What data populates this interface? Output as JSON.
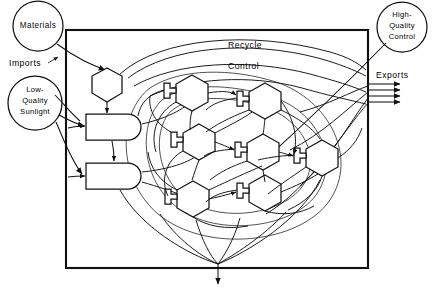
{
  "diagram": {
    "type": "odum-energy-systems-diagram",
    "background_color": "#ffffff",
    "line_color": "#111111"
  },
  "external_sources": [
    {
      "id": "materials",
      "label": "Materials",
      "shape": "circle",
      "cx": 38,
      "cy": 26,
      "r": 25
    },
    {
      "id": "sunlight",
      "label": "Low-\nQuality\nSunlight",
      "shape": "circle",
      "cx": 35,
      "cy": 103,
      "r": 27,
      "lines": [
        "Low-",
        "Quality",
        "Sunlight"
      ]
    },
    {
      "id": "hq-control",
      "label": "High-\nQuality\nControl",
      "shape": "circle",
      "cx": 402,
      "cy": 27,
      "r": 25,
      "lines": [
        "High-",
        "Quality",
        "Control"
      ]
    }
  ],
  "flow_labels": [
    {
      "id": "imports",
      "text": "Imports",
      "x": 9,
      "y": 66
    },
    {
      "id": "exports",
      "text": "Exports",
      "x": 376,
      "y": 78
    },
    {
      "id": "recycle",
      "text": "Recycle",
      "x": 228,
      "y": 48
    },
    {
      "id": "control",
      "text": "Control",
      "x": 228,
      "y": 69
    }
  ],
  "system_boundary": {
    "x": 66,
    "y": 30,
    "width": 302,
    "height": 238
  },
  "internal_symbols": [
    {
      "id": "producer",
      "type": "producer-hexagon",
      "cx": 107,
      "cy": 86
    },
    {
      "id": "storage-1",
      "type": "storage-tank",
      "x": 86,
      "y": 114,
      "w": 56,
      "h": 26
    },
    {
      "id": "storage-2",
      "type": "storage-tank",
      "x": 86,
      "y": 163,
      "w": 56,
      "h": 26
    },
    {
      "id": "consumer-1",
      "type": "consumer-hexagon",
      "cx": 192,
      "cy": 93
    },
    {
      "id": "consumer-2",
      "type": "consumer-hexagon",
      "cx": 265,
      "cy": 101
    },
    {
      "id": "consumer-3",
      "type": "consumer-hexagon",
      "cx": 199,
      "cy": 142
    },
    {
      "id": "consumer-4",
      "type": "consumer-hexagon",
      "cx": 263,
      "cy": 152
    },
    {
      "id": "consumer-5",
      "type": "consumer-hexagon",
      "cx": 322,
      "cy": 158
    },
    {
      "id": "consumer-6",
      "type": "consumer-hexagon",
      "cx": 193,
      "cy": 199
    },
    {
      "id": "consumer-7",
      "type": "consumer-hexagon",
      "cx": 265,
      "cy": 193
    }
  ],
  "heat_sink": {
    "id": "heat-sink-arrow",
    "x": 218,
    "y": 268,
    "direction": "down"
  },
  "export_arrows": {
    "count": 4,
    "x_start": 368,
    "x_end": 404,
    "y_values": [
      84,
      90,
      96,
      102
    ]
  }
}
